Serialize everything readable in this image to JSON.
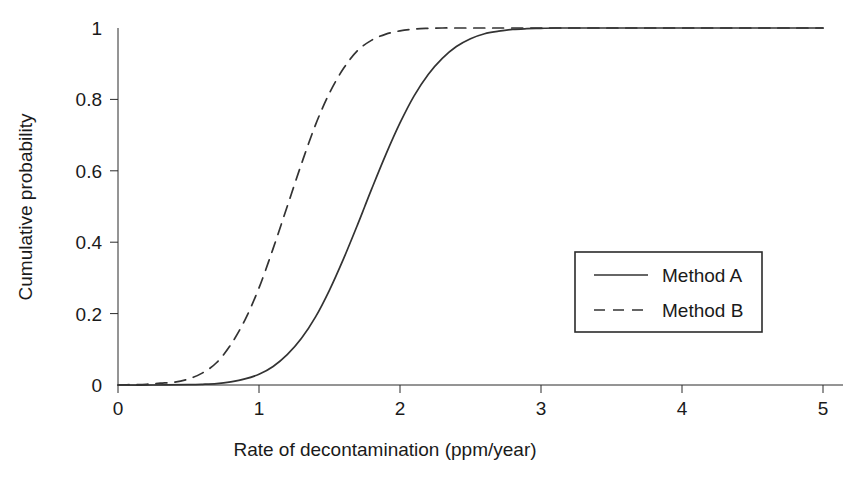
{
  "figure": {
    "background_color": "#ffffff",
    "ink_color": "#333333",
    "cropped_top_text": "............. ........ ......... ....."
  },
  "chart_data": {
    "type": "line",
    "title": "",
    "subtitle": "",
    "xlabel": "Rate of decontamination (ppm/year)",
    "ylabel": "Cumulative probability",
    "xlim": [
      0,
      5
    ],
    "ylim": [
      0,
      1
    ],
    "xticks": [
      0,
      1,
      2,
      3,
      4,
      5
    ],
    "xtick_labels": [
      "0",
      "1",
      "2",
      "3",
      "4",
      "5"
    ],
    "yticks": [
      0,
      0.2,
      0.4,
      0.6,
      0.8,
      1
    ],
    "ytick_labels": [
      "0",
      "0.2",
      "0.4",
      "0.6",
      "0.8",
      "1"
    ],
    "grid": false,
    "legend_position": "center-right",
    "series": [
      {
        "name": "Method A",
        "style": "solid",
        "color": "#333333",
        "distribution": "normal-cdf",
        "mean": 1.75,
        "stddev": 0.4,
        "x": [
          0.0,
          0.25,
          0.5,
          0.6,
          0.7,
          0.8,
          0.9,
          1.0,
          1.1,
          1.2,
          1.3,
          1.4,
          1.5,
          1.6,
          1.7,
          1.75,
          1.8,
          1.9,
          2.0,
          2.1,
          2.2,
          2.3,
          2.4,
          2.5,
          2.6,
          2.7,
          2.8,
          2.9,
          3.0,
          3.1,
          3.5,
          4.0,
          5.0
        ],
        "y": [
          0.0,
          0.0,
          0.001,
          0.002,
          0.004,
          0.009,
          0.017,
          0.03,
          0.052,
          0.085,
          0.13,
          0.19,
          0.266,
          0.354,
          0.45,
          0.5,
          0.55,
          0.646,
          0.734,
          0.81,
          0.87,
          0.915,
          0.948,
          0.97,
          0.984,
          0.991,
          0.996,
          0.998,
          0.999,
          1.0,
          1.0,
          1.0,
          1.0
        ]
      },
      {
        "name": "Method B",
        "style": "dashed",
        "color": "#333333",
        "distribution": "normal-cdf",
        "mean": 1.2,
        "stddev": 0.33,
        "x": [
          0.0,
          0.1,
          0.2,
          0.3,
          0.4,
          0.5,
          0.6,
          0.7,
          0.8,
          0.9,
          1.0,
          1.1,
          1.2,
          1.3,
          1.4,
          1.5,
          1.6,
          1.7,
          1.8,
          1.9,
          2.0,
          2.1,
          2.2,
          2.3,
          2.4,
          2.5,
          2.6,
          3.0,
          3.5,
          4.0,
          5.0
        ],
        "y": [
          0.0,
          0.001,
          0.002,
          0.005,
          0.008,
          0.017,
          0.034,
          0.063,
          0.113,
          0.182,
          0.272,
          0.382,
          0.5,
          0.618,
          0.728,
          0.818,
          0.887,
          0.937,
          0.966,
          0.983,
          0.992,
          0.997,
          0.999,
          1.0,
          1.0,
          1.0,
          1.0,
          1.0,
          1.0,
          1.0,
          1.0
        ]
      }
    ],
    "legend": [
      {
        "label": "Method A",
        "style": "solid"
      },
      {
        "label": "Method B",
        "style": "dashed"
      }
    ]
  }
}
